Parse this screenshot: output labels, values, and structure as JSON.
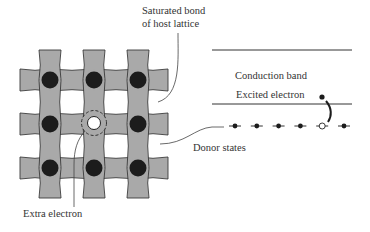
{
  "figure": {
    "type": "donor-impurity-diagram",
    "lattice": {
      "rows": 3,
      "cols": 3,
      "impurity_site": {
        "row": 1,
        "col": 1
      },
      "colors": {
        "bond": "#a9a9a9",
        "atom": "#1c1c1c",
        "outline": "#3a3a3a"
      }
    },
    "labels": {
      "saturated_bond_line1": "Saturated bond",
      "saturated_bond_line2": "of host lattice",
      "extra_electron": "Extra electron",
      "donor_states": "Donor states",
      "conduction_band": "Conduction band",
      "excited_electron": "Excited electron"
    },
    "donor_levels": {
      "count": 6,
      "ionized_index": 4
    }
  }
}
